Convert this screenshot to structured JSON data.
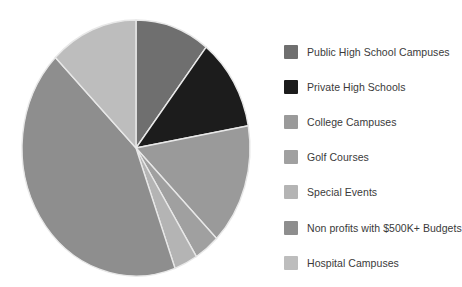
{
  "chart_data": {
    "type": "pie",
    "title": "",
    "legend_position": "right",
    "start_angle_deg": 0,
    "direction": "clockwise",
    "categories": [
      "Public High School Campuses",
      "Private High Schools",
      "College Campuses",
      "Golf Courses",
      "Special Events",
      "Non profits with $500K+ Budgets",
      "Hospital Campuses"
    ],
    "values": [
      10.6,
      11.7,
      15.3,
      3.6,
      3.3,
      43.0,
      12.5
    ],
    "units": "percent",
    "angles_deg": [
      38,
      42,
      55,
      13,
      12,
      155,
      45
    ],
    "colors": [
      "#6f6f6f",
      "#1c1c1c",
      "#9a9a9a",
      "#a0a0a0",
      "#b4b4b4",
      "#8e8e8e",
      "#bdbdbd"
    ],
    "slices": [
      {
        "label": "Public High School Campuses",
        "value": 10.6,
        "angle_deg": 38,
        "color": "#6f6f6f"
      },
      {
        "label": "Private High Schools",
        "value": 11.7,
        "angle_deg": 42,
        "color": "#1c1c1c"
      },
      {
        "label": "College Campuses",
        "value": 15.3,
        "angle_deg": 55,
        "color": "#9a9a9a"
      },
      {
        "label": "Golf Courses",
        "value": 3.6,
        "angle_deg": 13,
        "color": "#a0a0a0"
      },
      {
        "label": "Special Events",
        "value": 3.3,
        "angle_deg": 12,
        "color": "#b4b4b4"
      },
      {
        "label": "Non profits with $500K+ Budgets",
        "value": 43.0,
        "angle_deg": 155,
        "color": "#8e8e8e"
      },
      {
        "label": "Hospital Campuses",
        "value": 12.5,
        "angle_deg": 45,
        "color": "#bdbdbd"
      }
    ]
  },
  "legend": {
    "items": [
      {
        "label": "Public High School Campuses",
        "color": "#6f6f6f"
      },
      {
        "label": "Private High Schools",
        "color": "#1c1c1c"
      },
      {
        "label": "College Campuses",
        "color": "#9a9a9a"
      },
      {
        "label": "Golf Courses",
        "color": "#a0a0a0"
      },
      {
        "label": "Special Events",
        "color": "#b4b4b4"
      },
      {
        "label": "Non profits with $500K+ Budgets",
        "color": "#8e8e8e"
      },
      {
        "label": "Hospital Campuses",
        "color": "#bdbdbd"
      }
    ]
  },
  "style": {
    "background": "#ffffff",
    "slice_border": "#e8e8e8",
    "text_color": "#3a3a3a"
  }
}
